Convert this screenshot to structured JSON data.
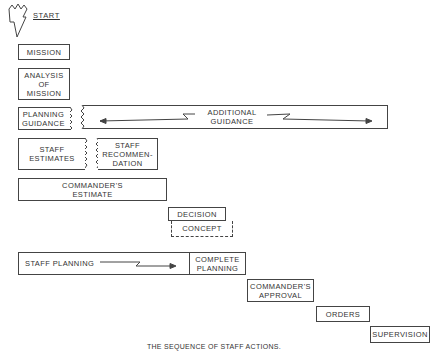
{
  "diagram": {
    "start_label": "START",
    "caption": "THE SEQUENCE OF STAFF ACTIONS.",
    "steps": {
      "mission": "MISSION",
      "analysis": "ANALYSIS\nOF\nMISSION",
      "planning_guidance": "PLANNING\nGUIDANCE",
      "additional_guidance": "ADDITIONAL\nGUIDANCE",
      "staff_estimates": "STAFF\nESTIMATES",
      "staff_recommendation": "STAFF\nRECOMMEN-\nDATION",
      "commanders_estimate": "COMMANDER'S\nESTIMATE",
      "decision": "DECISION",
      "concept": "CONCEPT",
      "staff_planning": "STAFF PLANNING",
      "complete_planning": "COMPLETE\nPLANNING",
      "commanders_approval": "COMMANDER'S\nAPPROVAL",
      "orders": "ORDERS",
      "supervision": "SUPERVISION"
    },
    "line_color": "#444444"
  }
}
